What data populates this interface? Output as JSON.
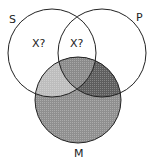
{
  "diagram": {
    "type": "venn",
    "circles": [
      {
        "id": "S",
        "label": "S",
        "cx": 52,
        "cy": 53,
        "r": 44
      },
      {
        "id": "P",
        "label": "P",
        "cx": 102,
        "cy": 53,
        "r": 44
      },
      {
        "id": "M",
        "label": "M",
        "cx": 78,
        "cy": 100,
        "r": 43
      }
    ],
    "marks": [
      {
        "region": "S only",
        "text": "X?"
      },
      {
        "region": "S and P, not M",
        "text": "X?"
      }
    ],
    "shading": {
      "S_and_M_only": "#bdbdbd",
      "S_and_P_and_M": "#8a8a8a",
      "P_and_M_only": "#5e5e5e",
      "M_only": "#8f8f8f"
    },
    "stroke_color": "#222222"
  }
}
